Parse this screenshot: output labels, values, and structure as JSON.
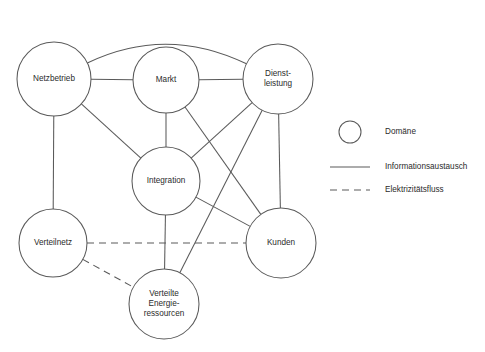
{
  "diagram": {
    "background_color": "#ffffff",
    "stroke_color": "#5a5a5a",
    "text_color": "#2b2b2b",
    "nodes": [
      {
        "id": "netzbetrieb",
        "label": "Netzbetrieb",
        "lines": [
          "Netzbetrieb"
        ],
        "cx": 54,
        "cy": 79,
        "r": 37
      },
      {
        "id": "markt",
        "label": "Markt",
        "lines": [
          "Markt"
        ],
        "cx": 166,
        "cy": 80,
        "r": 33
      },
      {
        "id": "dienstleistung",
        "label": "Dienstleistung",
        "lines": [
          "Dienst-",
          "leistung"
        ],
        "cx": 278,
        "cy": 79,
        "r": 35
      },
      {
        "id": "integration",
        "label": "Integration",
        "lines": [
          "Integration"
        ],
        "cx": 166,
        "cy": 181,
        "r": 34
      },
      {
        "id": "verteilnetz",
        "label": "Verteilnetz",
        "lines": [
          "Verteilnetz"
        ],
        "cx": 53,
        "cy": 243,
        "r": 34
      },
      {
        "id": "kunden",
        "label": "Kunden",
        "lines": [
          "Kunden"
        ],
        "cx": 281,
        "cy": 243,
        "r": 35
      },
      {
        "id": "verteilte_energieressourcen",
        "label": "Verteilte Energieressourcen",
        "lines": [
          "Verteilte",
          "Energie-",
          "ressourcen"
        ],
        "cx": 164,
        "cy": 304,
        "r": 35
      }
    ],
    "edges": [
      {
        "from": "netzbetrieb",
        "to": "dienstleistung",
        "type": "information",
        "shape": "arc",
        "arc_height": 54
      },
      {
        "from": "netzbetrieb",
        "to": "markt",
        "type": "information",
        "shape": "line"
      },
      {
        "from": "markt",
        "to": "dienstleistung",
        "type": "information",
        "shape": "line"
      },
      {
        "from": "netzbetrieb",
        "to": "verteilnetz",
        "type": "information",
        "shape": "line"
      },
      {
        "from": "netzbetrieb",
        "to": "integration",
        "type": "information",
        "shape": "line"
      },
      {
        "from": "markt",
        "to": "integration",
        "type": "information",
        "shape": "line"
      },
      {
        "from": "markt",
        "to": "kunden",
        "type": "information",
        "shape": "line"
      },
      {
        "from": "dienstleistung",
        "to": "integration",
        "type": "information",
        "shape": "line"
      },
      {
        "from": "dienstleistung",
        "to": "kunden",
        "type": "information",
        "shape": "line"
      },
      {
        "from": "dienstleistung",
        "to": "verteilte_energieressourcen",
        "type": "information",
        "shape": "line"
      },
      {
        "from": "integration",
        "to": "kunden",
        "type": "information",
        "shape": "line"
      },
      {
        "from": "integration",
        "to": "verteilte_energieressourcen",
        "type": "information",
        "shape": "line"
      },
      {
        "from": "verteilnetz",
        "to": "kunden",
        "type": "electricity",
        "shape": "line"
      },
      {
        "from": "verteilnetz",
        "to": "verteilte_energieressourcen",
        "type": "electricity",
        "shape": "line"
      }
    ]
  },
  "legend": {
    "items": [
      {
        "id": "domaene",
        "label": "Domäne",
        "symbol": "circle",
        "x": 350,
        "y": 132,
        "text_x": 385
      },
      {
        "id": "informationsaustausch",
        "label": "Informationsaustausch",
        "symbol": "solid-line",
        "x": 350,
        "y": 167,
        "text_x": 385
      },
      {
        "id": "elektrizitaetsfluss",
        "label": "Elektrizitätsfluss",
        "symbol": "dashed-line",
        "x": 350,
        "y": 190,
        "text_x": 385
      }
    ]
  }
}
